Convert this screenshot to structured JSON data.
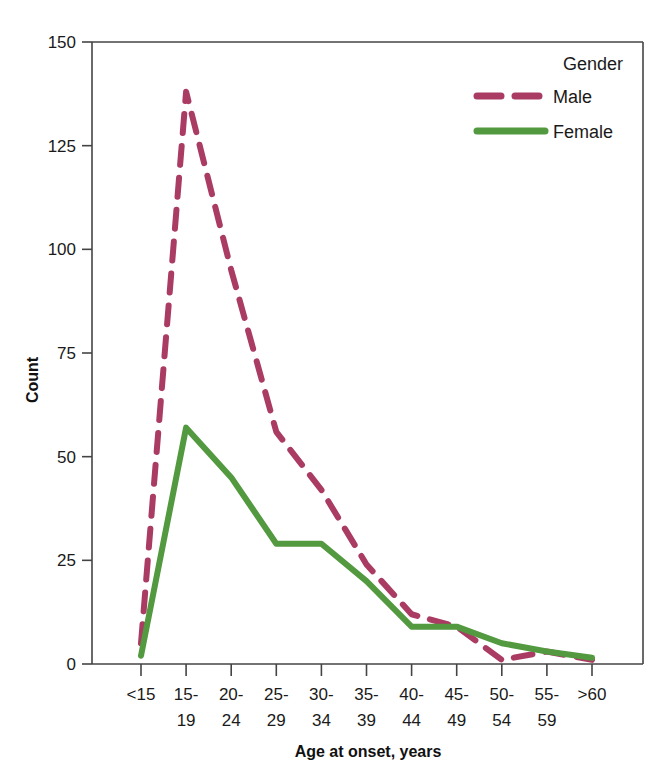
{
  "chart_data": {
    "type": "line",
    "title": "",
    "xlabel": "Age at onset, years",
    "ylabel": "Count",
    "categories": [
      "<15",
      "15-\n19",
      "20-\n24",
      "25-\n29",
      "30-\n34",
      "35-\n39",
      "40-\n44",
      "45-\n49",
      "50-\n54",
      "55-\n59",
      ">60"
    ],
    "category_lines": [
      [
        "<15",
        ""
      ],
      [
        "15-",
        "19"
      ],
      [
        "20-",
        "24"
      ],
      [
        "25-",
        "29"
      ],
      [
        "30-",
        "34"
      ],
      [
        "35-",
        "39"
      ],
      [
        "40-",
        "44"
      ],
      [
        "45-",
        "49"
      ],
      [
        "50-",
        "54"
      ],
      [
        "55-",
        "59"
      ],
      [
        ">60",
        ""
      ]
    ],
    "yticks": [
      0,
      25,
      50,
      75,
      100,
      125,
      150
    ],
    "ytick_labels": [
      "0",
      "25",
      "50",
      "75",
      "100",
      "125",
      "150"
    ],
    "ylim": [
      0,
      150
    ],
    "grid": false,
    "legend_position": "top-right",
    "legend_title": "Gender",
    "series": [
      {
        "name": "Male",
        "color": "#AA3B63",
        "style": "dashed",
        "values": [
          5,
          138,
          95,
          56,
          42,
          24,
          12,
          9,
          1,
          3,
          1
        ]
      },
      {
        "name": "Female",
        "color": "#52993F",
        "style": "solid",
        "values": [
          2,
          57,
          45,
          29,
          29,
          20,
          9,
          9,
          5,
          3,
          1.5
        ]
      }
    ]
  }
}
